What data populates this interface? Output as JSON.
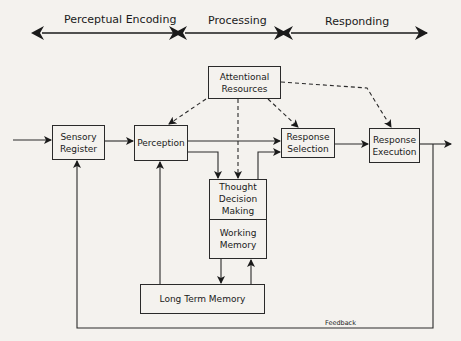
{
  "stages": [
    {
      "label": "Perceptual Encoding"
    },
    {
      "label": "Processing"
    },
    {
      "label": "Responding"
    }
  ],
  "boxes": {
    "attentional_resources": "Attentional Resources",
    "sensory_register": "Sensory Register",
    "perception": "Perception",
    "response_selection": "Response Selection",
    "response_execution": "Response Execution",
    "thought_decision_making": "Thought Decision Making",
    "working_memory": "Working Memory",
    "long_term_memory": "Long Term Memory"
  },
  "labels": {
    "feedback": "Feedback"
  },
  "colors": {
    "line": "#2a2a2a",
    "background": "#f4f2ee"
  }
}
